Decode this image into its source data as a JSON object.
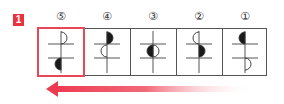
{
  "badge": {
    "label": "1",
    "color": "#e8333f"
  },
  "columns": [
    {
      "number": "⑤",
      "highlighted": true,
      "top_half": "right-open",
      "bottom_half": "left-filled",
      "desc": "Top: open semicircle right of vertical line above upper bar; Bottom: filled semicircle left, below lower bar"
    },
    {
      "number": "④",
      "highlighted": false,
      "top_half": "right-filled",
      "bottom_half": "left-open",
      "desc": "Filled right semicircle above upper bar; open left semicircle between bars"
    },
    {
      "number": "③",
      "highlighted": false,
      "top_half": "left-filled",
      "bottom_half": "right-open",
      "desc": "Circle between bars: left half filled, right half open"
    },
    {
      "number": "②",
      "highlighted": false,
      "top_half": "left-open",
      "bottom_half": "right-filled",
      "desc": "Open left semicircle above upper bar; filled right semicircle between bars"
    },
    {
      "number": "①",
      "highlighted": false,
      "top_half": "left-filled",
      "bottom_half": "right-open",
      "desc": "Filled left semicircle above upper bar; open right semicircle below lower bar"
    }
  ],
  "arrow": {
    "direction": "left",
    "color": "#ee3a50"
  },
  "colors": {
    "highlight": "#e8475a",
    "line": "#555555",
    "fill": "#1a1a1a"
  }
}
